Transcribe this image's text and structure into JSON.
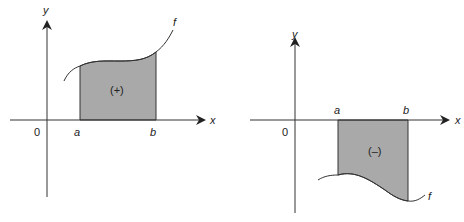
{
  "figure": {
    "panels": [
      {
        "id": "positive",
        "axis_x_label": "x",
        "axis_y_label": "y",
        "origin_label": "0",
        "bound_a_label": "a",
        "bound_b_label": "b",
        "function_label": "f",
        "region_label": "(+)",
        "region_sign": "positive"
      },
      {
        "id": "negative",
        "axis_x_label": "x",
        "axis_y_label": "y",
        "origin_label": "0",
        "bound_a_label": "a",
        "bound_b_label": "b",
        "function_label": "f",
        "region_label": "(–)",
        "region_sign": "negative"
      }
    ],
    "colors": {
      "region_fill": "#a9a9a9",
      "line": "#333333",
      "background": "#ffffff"
    }
  }
}
